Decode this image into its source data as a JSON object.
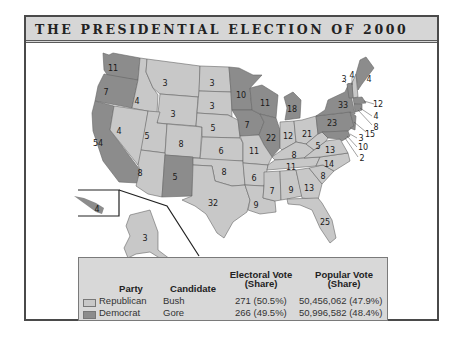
{
  "title": "THE PRESIDENTIAL ELECTION OF 2000",
  "colors": {
    "republican": "#c8c8c8",
    "democrat": "#8c8c8c",
    "border": "#555555",
    "frame_bg": "#ffffff",
    "legend_bg": "#d8d8d8"
  },
  "legend": {
    "headers": {
      "party": "Party",
      "candidate": "Candidate",
      "electoral": "Electoral Vote (Share)",
      "electoral_l1": "Electoral Vote",
      "electoral_l2": "(Share)",
      "popular_l1": "Popular Vote",
      "popular_l2": "(Share)"
    },
    "rows": [
      {
        "party": "Republican",
        "candidate": "Bush",
        "electoral": "271 (50.5%)",
        "popular": "50,456,062 (47.9%)",
        "swatch": "republican"
      },
      {
        "party": "Democrat",
        "candidate": "Gore",
        "electoral": "266 (49.5%)",
        "popular": "50,996,582 (48.4%)",
        "swatch": "democrat"
      }
    ]
  },
  "states": [
    {
      "abbr": "WA",
      "ev": "11",
      "party": "D",
      "x": 113,
      "y": 68
    },
    {
      "abbr": "OR",
      "ev": "7",
      "party": "D",
      "x": 106,
      "y": 92
    },
    {
      "abbr": "CA",
      "ev": "54",
      "party": "D",
      "x": 98,
      "y": 143
    },
    {
      "abbr": "ID",
      "ev": "4",
      "party": "R",
      "x": 137,
      "y": 101
    },
    {
      "abbr": "NV",
      "ev": "4",
      "party": "R",
      "x": 119,
      "y": 131
    },
    {
      "abbr": "MT",
      "ev": "3",
      "party": "R",
      "x": 165,
      "y": 83
    },
    {
      "abbr": "WY",
      "ev": "3",
      "party": "R",
      "x": 173,
      "y": 114
    },
    {
      "abbr": "UT",
      "ev": "5",
      "party": "R",
      "x": 147,
      "y": 136
    },
    {
      "abbr": "CO",
      "ev": "8",
      "party": "R",
      "x": 181,
      "y": 144
    },
    {
      "abbr": "AZ",
      "ev": "8",
      "party": "R",
      "x": 140,
      "y": 173
    },
    {
      "abbr": "NM",
      "ev": "5",
      "party": "D",
      "x": 175,
      "y": 177
    },
    {
      "abbr": "ND",
      "ev": "3",
      "party": "R",
      "x": 212,
      "y": 83
    },
    {
      "abbr": "SD",
      "ev": "3",
      "party": "R",
      "x": 212,
      "y": 106
    },
    {
      "abbr": "NE",
      "ev": "5",
      "party": "R",
      "x": 213,
      "y": 128
    },
    {
      "abbr": "KS",
      "ev": "6",
      "party": "R",
      "x": 221,
      "y": 151
    },
    {
      "abbr": "OK",
      "ev": "8",
      "party": "R",
      "x": 224,
      "y": 172
    },
    {
      "abbr": "TX",
      "ev": "32",
      "party": "R",
      "x": 213,
      "y": 203
    },
    {
      "abbr": "MN",
      "ev": "10",
      "party": "D",
      "x": 241,
      "y": 95
    },
    {
      "abbr": "IA",
      "ev": "7",
      "party": "D",
      "x": 247,
      "y": 125
    },
    {
      "abbr": "MO",
      "ev": "11",
      "party": "R",
      "x": 254,
      "y": 151
    },
    {
      "abbr": "AR",
      "ev": "6",
      "party": "R",
      "x": 254,
      "y": 178
    },
    {
      "abbr": "LA",
      "ev": "9",
      "party": "R",
      "x": 256,
      "y": 205
    },
    {
      "abbr": "WI",
      "ev": "11",
      "party": "D",
      "x": 265,
      "y": 103
    },
    {
      "abbr": "IL",
      "ev": "22",
      "party": "D",
      "x": 271,
      "y": 138
    },
    {
      "abbr": "MI",
      "ev": "18",
      "party": "D",
      "x": 292,
      "y": 109
    },
    {
      "abbr": "IN",
      "ev": "12",
      "party": "R",
      "x": 288,
      "y": 136
    },
    {
      "abbr": "OH",
      "ev": "21",
      "party": "R",
      "x": 307,
      "y": 134
    },
    {
      "abbr": "KY",
      "ev": "8",
      "party": "R",
      "x": 294,
      "y": 155
    },
    {
      "abbr": "TN",
      "ev": "11",
      "party": "R",
      "x": 291,
      "y": 167
    },
    {
      "abbr": "MS",
      "ev": "7",
      "party": "R",
      "x": 272,
      "y": 191
    },
    {
      "abbr": "AL",
      "ev": "9",
      "party": "R",
      "x": 291,
      "y": 190
    },
    {
      "abbr": "GA",
      "ev": "13",
      "party": "R",
      "x": 309,
      "y": 188
    },
    {
      "abbr": "FL",
      "ev": "25",
      "party": "R",
      "x": 325,
      "y": 222
    },
    {
      "abbr": "SC",
      "ev": "8",
      "party": "R",
      "x": 323,
      "y": 176
    },
    {
      "abbr": "NC",
      "ev": "14",
      "party": "R",
      "x": 329,
      "y": 164
    },
    {
      "abbr": "VA",
      "ev": "13",
      "party": "R",
      "x": 330,
      "y": 150
    },
    {
      "abbr": "WV",
      "ev": "5",
      "party": "R",
      "x": 318,
      "y": 146
    },
    {
      "abbr": "PA",
      "ev": "23",
      "party": "D",
      "x": 332,
      "y": 123
    },
    {
      "abbr": "NY",
      "ev": "33",
      "party": "D",
      "x": 343,
      "y": 105
    },
    {
      "abbr": "VT",
      "ev": "3",
      "party": "D",
      "x": 344,
      "y": 79
    },
    {
      "abbr": "NH",
      "ev": "4",
      "party": "R",
      "x": 352,
      "y": 75
    },
    {
      "abbr": "ME",
      "ev": "4",
      "party": "D",
      "x": 369,
      "y": 79
    },
    {
      "abbr": "MA",
      "ev": "12",
      "party": "D",
      "x": 378,
      "y": 104
    },
    {
      "abbr": "RI",
      "ev": "4",
      "party": "D",
      "x": 376,
      "y": 116
    },
    {
      "abbr": "CT",
      "ev": "8",
      "party": "D",
      "x": 376,
      "y": 127
    },
    {
      "abbr": "NJ",
      "ev": "15",
      "party": "D",
      "x": 370,
      "y": 134
    },
    {
      "abbr": "DE",
      "ev": "3",
      "party": "D",
      "x": 361,
      "y": 138
    },
    {
      "abbr": "MD",
      "ev": "10",
      "party": "D",
      "x": 363,
      "y": 147
    },
    {
      "abbr": "DC",
      "ev": "2",
      "party": "D",
      "x": 362,
      "y": 158
    },
    {
      "abbr": "HI",
      "ev": "4",
      "party": "D",
      "x": 97,
      "y": 209
    },
    {
      "abbr": "AK",
      "ev": "3",
      "party": "R",
      "x": 145,
      "y": 238
    }
  ]
}
